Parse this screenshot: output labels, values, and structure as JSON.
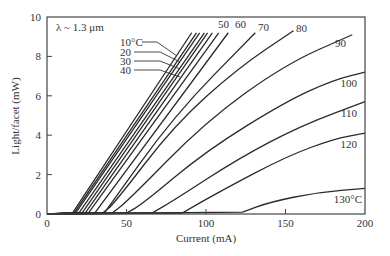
{
  "chart_data": {
    "type": "line",
    "title": "",
    "xlabel": "Current (mA)",
    "ylabel": "Light/facet (mW)",
    "xlim": [
      0,
      200
    ],
    "ylim": [
      0,
      10
    ],
    "xticks": [
      0,
      50,
      100,
      150,
      200
    ],
    "yticks": [
      0,
      2,
      4,
      6,
      8,
      10
    ],
    "grid": false,
    "annotation": "λ ~ 1.3 μm",
    "series": [
      {
        "name": "10°C",
        "label": "10°C",
        "points": [
          [
            0,
            0
          ],
          [
            16,
            0.05
          ],
          [
            91,
            9.2
          ]
        ]
      },
      {
        "name": "20°C",
        "label": "20",
        "points": [
          [
            0,
            0
          ],
          [
            17,
            0.05
          ],
          [
            94,
            9.2
          ]
        ]
      },
      {
        "name": "30°C",
        "label": "30",
        "points": [
          [
            0,
            0
          ],
          [
            18,
            0.05
          ],
          [
            96,
            9.2
          ]
        ]
      },
      {
        "name": "40°C",
        "label": "40",
        "points": [
          [
            0,
            0
          ],
          [
            20,
            0.05
          ],
          [
            99,
            9.2
          ]
        ]
      },
      {
        "name": "45°C",
        "label": "",
        "points": [
          [
            0,
            0
          ],
          [
            22,
            0.05
          ],
          [
            101,
            9.2
          ]
        ]
      },
      {
        "name": "48°C",
        "label": "",
        "points": [
          [
            0,
            0
          ],
          [
            24,
            0.05
          ],
          [
            104,
            9.2
          ]
        ]
      },
      {
        "name": "50°C",
        "label": "50",
        "points": [
          [
            0,
            0
          ],
          [
            26,
            0.05
          ],
          [
            108,
            9.2
          ]
        ]
      },
      {
        "name": "60°C",
        "label": "60",
        "points": [
          [
            0,
            0
          ],
          [
            30,
            0.05
          ],
          [
            114,
            9.2
          ]
        ]
      },
      {
        "name": "70°C",
        "label": "70",
        "points": [
          [
            0,
            0
          ],
          [
            36,
            0.05
          ],
          [
            80,
            5.0
          ],
          [
            131,
            9.2
          ]
        ]
      },
      {
        "name": "80°C",
        "label": "80",
        "points": [
          [
            0,
            0
          ],
          [
            35,
            0.05
          ],
          [
            42,
            0.5
          ],
          [
            80,
            4.5
          ],
          [
            120,
            7.4
          ],
          [
            155,
            9.3
          ]
        ]
      },
      {
        "name": "90°C",
        "label": "90",
        "points": [
          [
            0,
            0
          ],
          [
            41,
            0.05
          ],
          [
            50,
            0.6
          ],
          [
            100,
            4.7
          ],
          [
            150,
            7.6
          ],
          [
            192,
            9.1
          ]
        ]
      },
      {
        "name": "100°C",
        "label": "100",
        "points": [
          [
            0,
            0
          ],
          [
            50,
            0.05
          ],
          [
            60,
            0.5
          ],
          [
            100,
            3.2
          ],
          [
            150,
            5.7
          ],
          [
            180,
            6.8
          ],
          [
            200,
            7.2
          ]
        ]
      },
      {
        "name": "110°C",
        "label": "110",
        "points": [
          [
            0,
            0
          ],
          [
            66,
            0.05
          ],
          [
            80,
            0.7
          ],
          [
            120,
            2.8
          ],
          [
            160,
            4.5
          ],
          [
            200,
            5.7
          ]
        ]
      },
      {
        "name": "120°C",
        "label": "120",
        "points": [
          [
            0,
            0
          ],
          [
            85,
            0.05
          ],
          [
            110,
            1.2
          ],
          [
            150,
            2.9
          ],
          [
            180,
            3.8
          ],
          [
            200,
            4.1
          ]
        ]
      },
      {
        "name": "130°C",
        "label": "130°C",
        "points": [
          [
            0,
            0
          ],
          [
            123,
            0.1
          ],
          [
            140,
            0.6
          ],
          [
            170,
            1.1
          ],
          [
            200,
            1.3
          ]
        ]
      }
    ]
  }
}
